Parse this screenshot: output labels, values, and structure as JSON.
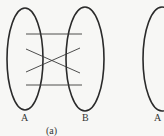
{
  "figure": {
    "caption": "(a)",
    "sets": [
      {
        "id": "A",
        "label": "A",
        "cx": 25,
        "cy": 59,
        "rx": 18,
        "ry": 51
      },
      {
        "id": "B",
        "label": "B",
        "cx": 85,
        "cy": 59,
        "rx": 19,
        "ry": 52
      },
      {
        "id": "A2",
        "label": "A",
        "cx": 162,
        "cy": 59,
        "rx": 19,
        "ry": 52
      }
    ],
    "mappings": [
      {
        "x1": 26,
        "y1": 34,
        "x2": 82,
        "y2": 34
      },
      {
        "x1": 26,
        "y1": 49,
        "x2": 80,
        "y2": 73
      },
      {
        "x1": 26,
        "y1": 72,
        "x2": 80,
        "y2": 48
      },
      {
        "x1": 26,
        "y1": 85,
        "x2": 82,
        "y2": 85
      }
    ],
    "colors": {
      "stroke": "#2a2a2a",
      "background": "#f7f7f5"
    }
  }
}
